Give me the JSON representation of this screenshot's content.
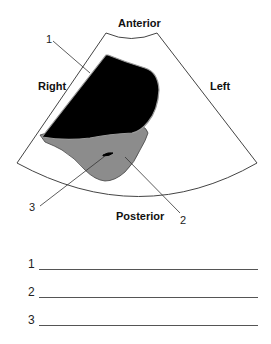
{
  "diagram": {
    "orientation_labels": {
      "anterior": "Anterior",
      "posterior": "Posterior",
      "right": "Right",
      "left": "Left"
    },
    "callouts": [
      {
        "number": "1",
        "target": "black-region"
      },
      {
        "number": "2",
        "target": "gray-region"
      },
      {
        "number": "3",
        "target": "small-dark-structure"
      }
    ],
    "colors": {
      "black_region": "#000000",
      "gray_region": "#8c8c8c",
      "outline": "#444444"
    }
  },
  "answers": [
    {
      "number": "1",
      "value": ""
    },
    {
      "number": "2",
      "value": ""
    },
    {
      "number": "3",
      "value": ""
    }
  ]
}
